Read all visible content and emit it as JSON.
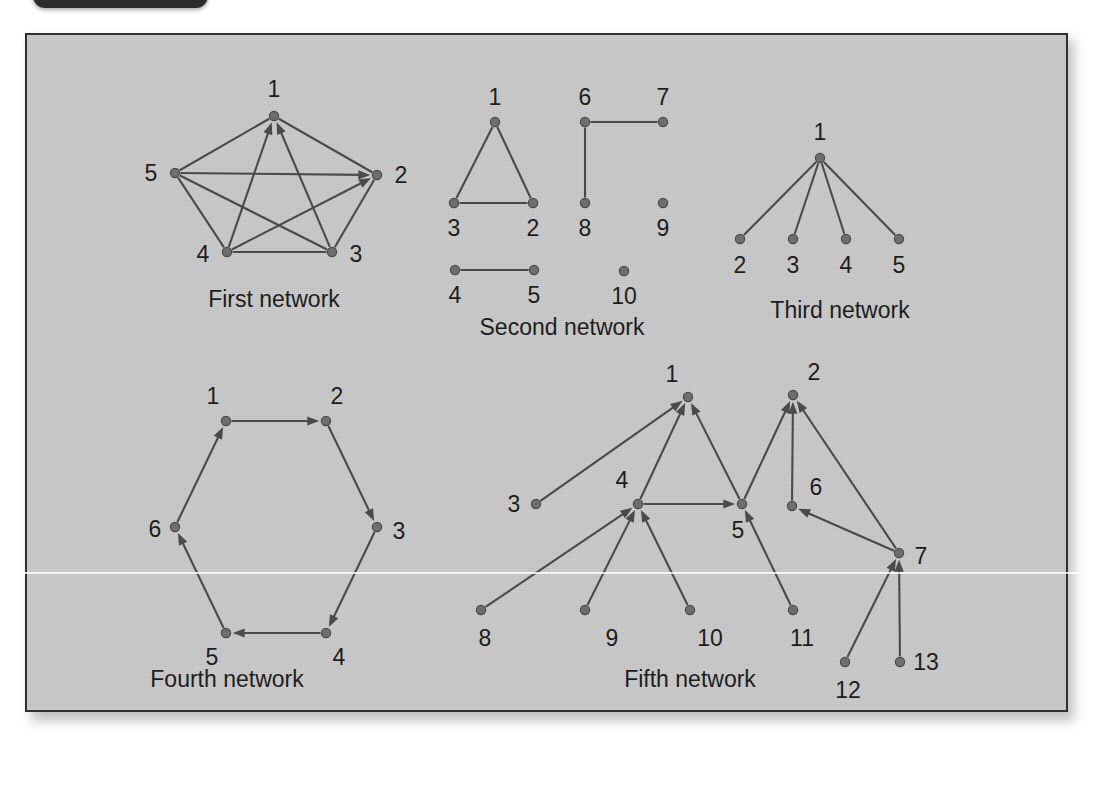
{
  "figure": {
    "background_color": "#c9c9c9",
    "border_color": "#2f2f2f",
    "node_color": "#6e6e6e",
    "edge_color": "#4a4a4a",
    "label_color": "#1d1d1d"
  },
  "corner_tab": {
    "label": ""
  },
  "networks": [
    {
      "id": "first-network",
      "caption": "First network",
      "caption_pos": [
        274,
        299
      ],
      "directed": true,
      "nodes": [
        {
          "id": "1",
          "label": "1",
          "x": 274,
          "y": 116,
          "lx": 274,
          "ly": 89
        },
        {
          "id": "2",
          "label": "2",
          "x": 377,
          "y": 175,
          "lx": 401,
          "ly": 175
        },
        {
          "id": "3",
          "label": "3",
          "x": 332,
          "y": 252,
          "lx": 356,
          "ly": 254
        },
        {
          "id": "4",
          "label": "4",
          "x": 227,
          "y": 252,
          "lx": 203,
          "ly": 254
        },
        {
          "id": "5",
          "label": "5",
          "x": 175,
          "y": 173,
          "lx": 151,
          "ly": 173
        }
      ],
      "edges": [
        {
          "from": "5",
          "to": "1",
          "arrow": false
        },
        {
          "from": "1",
          "to": "2",
          "arrow": false
        },
        {
          "from": "2",
          "to": "3",
          "arrow": false
        },
        {
          "from": "3",
          "to": "4",
          "arrow": false
        },
        {
          "from": "4",
          "to": "5",
          "arrow": false
        },
        {
          "from": "5",
          "to": "2",
          "arrow": true
        },
        {
          "from": "4",
          "to": "2",
          "arrow": true
        },
        {
          "from": "4",
          "to": "1",
          "arrow": true
        },
        {
          "from": "3",
          "to": "1",
          "arrow": true
        },
        {
          "from": "5",
          "to": "3",
          "arrow": false
        }
      ]
    },
    {
      "id": "second-network",
      "caption": "Second network",
      "caption_pos": [
        562,
        327
      ],
      "directed": false,
      "nodes": [
        {
          "id": "1",
          "label": "1",
          "x": 495,
          "y": 122,
          "lx": 495,
          "ly": 97
        },
        {
          "id": "3",
          "label": "3",
          "x": 454,
          "y": 203,
          "lx": 454,
          "ly": 228
        },
        {
          "id": "2",
          "label": "2",
          "x": 533,
          "y": 203,
          "lx": 533,
          "ly": 228
        },
        {
          "id": "6",
          "label": "6",
          "x": 585,
          "y": 122,
          "lx": 585,
          "ly": 97
        },
        {
          "id": "7",
          "label": "7",
          "x": 663,
          "y": 122,
          "lx": 663,
          "ly": 97
        },
        {
          "id": "8",
          "label": "8",
          "x": 585,
          "y": 203,
          "lx": 585,
          "ly": 228
        },
        {
          "id": "9",
          "label": "9",
          "x": 663,
          "y": 203,
          "lx": 663,
          "ly": 228
        },
        {
          "id": "4",
          "label": "4",
          "x": 455,
          "y": 270,
          "lx": 455,
          "ly": 295
        },
        {
          "id": "5",
          "label": "5",
          "x": 534,
          "y": 270,
          "lx": 534,
          "ly": 295
        },
        {
          "id": "10",
          "label": "10",
          "x": 624,
          "y": 271,
          "lx": 624,
          "ly": 296
        }
      ],
      "edges": [
        {
          "from": "1",
          "to": "3",
          "arrow": false
        },
        {
          "from": "1",
          "to": "2",
          "arrow": false
        },
        {
          "from": "3",
          "to": "2",
          "arrow": false
        },
        {
          "from": "6",
          "to": "7",
          "arrow": false
        },
        {
          "from": "6",
          "to": "8",
          "arrow": false
        },
        {
          "from": "4",
          "to": "5",
          "arrow": false
        }
      ]
    },
    {
      "id": "third-network",
      "caption": "Third network",
      "caption_pos": [
        840,
        310
      ],
      "directed": false,
      "nodes": [
        {
          "id": "1",
          "label": "1",
          "x": 820,
          "y": 158,
          "lx": 820,
          "ly": 132
        },
        {
          "id": "2",
          "label": "2",
          "x": 740,
          "y": 239,
          "lx": 740,
          "ly": 265
        },
        {
          "id": "3",
          "label": "3",
          "x": 793,
          "y": 239,
          "lx": 793,
          "ly": 265
        },
        {
          "id": "4",
          "label": "4",
          "x": 846,
          "y": 239,
          "lx": 846,
          "ly": 265
        },
        {
          "id": "5",
          "label": "5",
          "x": 899,
          "y": 239,
          "lx": 899,
          "ly": 265
        }
      ],
      "edges": [
        {
          "from": "1",
          "to": "2",
          "arrow": false
        },
        {
          "from": "1",
          "to": "3",
          "arrow": false
        },
        {
          "from": "1",
          "to": "4",
          "arrow": false
        },
        {
          "from": "1",
          "to": "5",
          "arrow": false
        }
      ]
    },
    {
      "id": "fourth-network",
      "caption": "Fourth network",
      "caption_pos": [
        227,
        679
      ],
      "directed": true,
      "nodes": [
        {
          "id": "1",
          "label": "1",
          "x": 226,
          "y": 421,
          "lx": 213,
          "ly": 396
        },
        {
          "id": "2",
          "label": "2",
          "x": 326,
          "y": 421,
          "lx": 337,
          "ly": 396
        },
        {
          "id": "3",
          "label": "3",
          "x": 377,
          "y": 527,
          "lx": 399,
          "ly": 531
        },
        {
          "id": "4",
          "label": "4",
          "x": 326,
          "y": 633,
          "lx": 339,
          "ly": 657
        },
        {
          "id": "5",
          "label": "5",
          "x": 226,
          "y": 633,
          "lx": 212,
          "ly": 657
        },
        {
          "id": "6",
          "label": "6",
          "x": 175,
          "y": 527,
          "lx": 155,
          "ly": 529
        }
      ],
      "edges": [
        {
          "from": "1",
          "to": "2",
          "arrow": true
        },
        {
          "from": "2",
          "to": "3",
          "arrow": true
        },
        {
          "from": "3",
          "to": "4",
          "arrow": true
        },
        {
          "from": "4",
          "to": "5",
          "arrow": true
        },
        {
          "from": "5",
          "to": "6",
          "arrow": true
        },
        {
          "from": "6",
          "to": "1",
          "arrow": true
        }
      ]
    },
    {
      "id": "fifth-network",
      "caption": "Fifth network",
      "caption_pos": [
        690,
        679
      ],
      "directed": true,
      "nodes": [
        {
          "id": "1",
          "label": "1",
          "x": 688,
          "y": 397,
          "lx": 672,
          "ly": 374
        },
        {
          "id": "2",
          "label": "2",
          "x": 793,
          "y": 395,
          "lx": 814,
          "ly": 372
        },
        {
          "id": "3",
          "label": "3",
          "x": 536,
          "y": 504,
          "lx": 514,
          "ly": 504
        },
        {
          "id": "4",
          "label": "4",
          "x": 638,
          "y": 504,
          "lx": 622,
          "ly": 480
        },
        {
          "id": "5",
          "label": "5",
          "x": 742,
          "y": 504,
          "lx": 738,
          "ly": 530
        },
        {
          "id": "6",
          "label": "6",
          "x": 792,
          "y": 506,
          "lx": 816,
          "ly": 487
        },
        {
          "id": "7",
          "label": "7",
          "x": 899,
          "y": 553,
          "lx": 921,
          "ly": 556
        },
        {
          "id": "8",
          "label": "8",
          "x": 481,
          "y": 610,
          "lx": 485,
          "ly": 638
        },
        {
          "id": "9",
          "label": "9",
          "x": 585,
          "y": 610,
          "lx": 612,
          "ly": 638
        },
        {
          "id": "10",
          "label": "10",
          "x": 690,
          "y": 610,
          "lx": 710,
          "ly": 638
        },
        {
          "id": "11",
          "label": "11",
          "x": 793,
          "y": 610,
          "lx": 802,
          "ly": 638
        },
        {
          "id": "12",
          "label": "12",
          "x": 845,
          "y": 662,
          "lx": 848,
          "ly": 690
        },
        {
          "id": "13",
          "label": "13",
          "x": 900,
          "y": 662,
          "lx": 926,
          "ly": 662
        }
      ],
      "edges": [
        {
          "from": "3",
          "to": "1",
          "arrow": true
        },
        {
          "from": "4",
          "to": "1",
          "arrow": true
        },
        {
          "from": "5",
          "to": "1",
          "arrow": true
        },
        {
          "from": "4",
          "to": "5",
          "arrow": true
        },
        {
          "from": "8",
          "to": "4",
          "arrow": true
        },
        {
          "from": "9",
          "to": "4",
          "arrow": true
        },
        {
          "from": "10",
          "to": "4",
          "arrow": true
        },
        {
          "from": "5",
          "to": "2",
          "arrow": true
        },
        {
          "from": "6",
          "to": "2",
          "arrow": true
        },
        {
          "from": "7",
          "to": "2",
          "arrow": true
        },
        {
          "from": "11",
          "to": "5",
          "arrow": true
        },
        {
          "from": "7",
          "to": "6",
          "arrow": true
        },
        {
          "from": "12",
          "to": "7",
          "arrow": true
        },
        {
          "from": "13",
          "to": "7",
          "arrow": true
        }
      ]
    }
  ]
}
